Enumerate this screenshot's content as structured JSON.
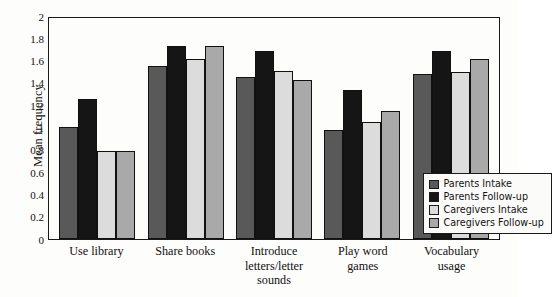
{
  "chart_data": {
    "type": "bar",
    "title": "",
    "xlabel": "",
    "ylabel": "Mean frequency",
    "ylim": [
      0,
      2
    ],
    "yticks": [
      "0",
      "0.2",
      "0.4",
      "0.6",
      "0.8",
      "1",
      "1.2",
      "1.4",
      "1.6",
      "1.8",
      "2"
    ],
    "ytick_values": [
      0,
      0.2,
      0.4,
      0.6,
      0.8,
      1,
      1.2,
      1.4,
      1.6,
      1.8,
      2
    ],
    "grid": false,
    "legend_position": "lower-right-inside",
    "categories": [
      "Use library",
      "Share books",
      "Introduce\nletters/letter\nsounds",
      "Play word\ngames",
      "Vocabulary\nusage"
    ],
    "series": [
      {
        "name": "Parents Intake",
        "color": "#595959",
        "values": [
          1.01,
          1.57,
          1.47,
          0.99,
          1.49
        ]
      },
      {
        "name": "Parents Follow-up",
        "color": "#151515",
        "values": [
          1.27,
          1.75,
          1.7,
          1.35,
          1.7
        ]
      },
      {
        "name": "Caregivers Intake",
        "color": "#dcdcdc",
        "values": [
          0.8,
          1.63,
          1.52,
          1.06,
          1.51
        ]
      },
      {
        "name": "Caregivers Follow-up",
        "color": "#a9a9a9",
        "values": [
          0.8,
          1.75,
          1.44,
          1.16,
          1.63
        ]
      }
    ]
  }
}
